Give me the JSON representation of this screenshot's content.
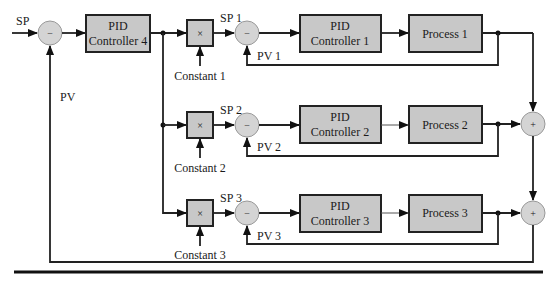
{
  "diagram": {
    "type": "cascade-ratio PID control block diagram",
    "inputs": {
      "sp": "SP",
      "pv": "PV"
    },
    "master": {
      "label_line1": "PID",
      "label_line2": "Controller 4",
      "sum_sign": "−"
    },
    "loops": [
      {
        "sp": "SP 1",
        "pv": "PV 1",
        "constant": "Constant 1",
        "mult": "×",
        "sum_sign": "−",
        "controller_line1": "PID",
        "controller_line2": "Controller 1",
        "process": "Process 1"
      },
      {
        "sp": "SP 2",
        "pv": "PV 2",
        "constant": "Constant 2",
        "mult": "×",
        "sum_sign": "−",
        "controller_line1": "PID",
        "controller_line2": "Controller 2",
        "process": "Process 2"
      },
      {
        "sp": "SP 3",
        "pv": "PV 3",
        "constant": "Constant 3",
        "mult": "×",
        "sum_sign": "−",
        "controller_line1": "PID",
        "controller_line2": "Controller 3",
        "process": "Process 3"
      }
    ],
    "adders": [
      {
        "sign": "+"
      },
      {
        "sign": "+"
      }
    ],
    "colors": {
      "block_fill": "#c8c8c8",
      "sum_fill": "#d4d4d4",
      "line": "#222222"
    }
  }
}
